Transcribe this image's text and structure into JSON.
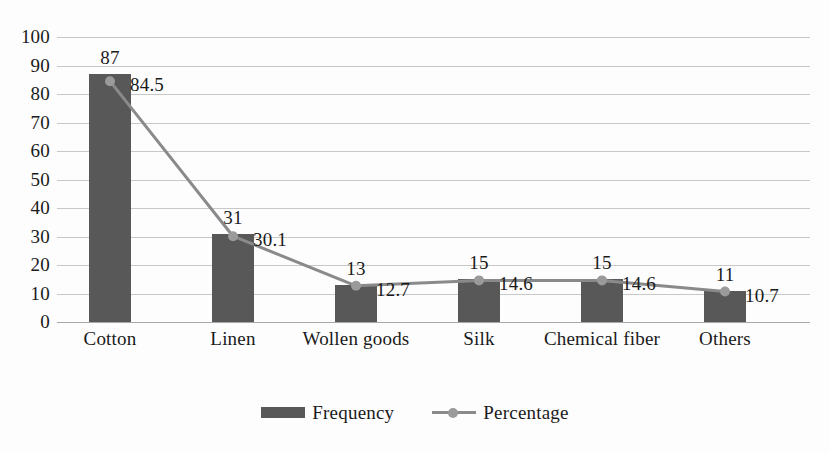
{
  "chart_data": {
    "type": "bar",
    "title": "",
    "subtitle": "",
    "xlabel": "",
    "ylabel": "",
    "ylim": [
      0,
      100
    ],
    "ytick_step": 10,
    "yticks": [
      "100",
      "90",
      "80",
      "70",
      "60",
      "50",
      "40",
      "30",
      "20",
      "10",
      "0"
    ],
    "grid": true,
    "legend_position": "bottom-center",
    "categories": [
      "Cotton",
      "Linen",
      "Wollen goods",
      "Silk",
      "Chemical fiber",
      "Others"
    ],
    "series": [
      {
        "name": "Frequency",
        "type": "bar",
        "color": "#585858",
        "values": [
          87,
          31,
          13,
          15,
          15,
          11
        ],
        "labels": [
          "87",
          "31",
          "13",
          "15",
          "15",
          "11"
        ]
      },
      {
        "name": "Percentage",
        "type": "line",
        "color": "#8a8a8a",
        "marker_color": "#9a9a9a",
        "values": [
          84.5,
          30.1,
          12.7,
          14.6,
          14.6,
          10.7
        ],
        "labels": [
          "84.5",
          "30.1",
          "12.7",
          "14.6",
          "14.6",
          "10.7"
        ]
      }
    ]
  },
  "legend": {
    "items": [
      {
        "label": "Frequency",
        "swatch": "bar-swatch-icon"
      },
      {
        "label": "Percentage",
        "swatch": "line-marker-icon"
      }
    ]
  },
  "colors": {
    "bar": "#585858",
    "line": "#8a8a8a",
    "marker": "#9a9a9a",
    "gridline": "#c8c8c8",
    "axis": "#a8a8a8",
    "text": "#1a1a1a",
    "background": "#fdfdfd"
  }
}
